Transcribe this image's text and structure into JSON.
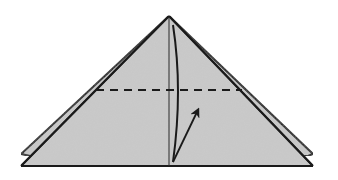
{
  "diagram": {
    "type": "origami-step",
    "description": "Triangle folded model with dashed valley fold line and arrow indicating fold upward",
    "colors": {
      "paper": "#c8c8c8",
      "outline": "#1a1a1a",
      "background": "#ffffff"
    },
    "elements": {
      "back_layer": "back-layer-triangle",
      "front_layer": "front-layer-triangle",
      "center_crease": "center-crease-line",
      "fold_line": "dashed-valley-fold",
      "arrow": "fold-up-arrow"
    }
  }
}
